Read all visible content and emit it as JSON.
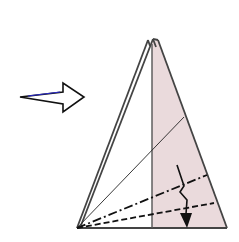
{
  "diagram": {
    "type": "origami-fold-step",
    "colors": {
      "paper_back": "#eadadc",
      "paper_front": "#ffffff",
      "outline": "#444444",
      "line": "#111111",
      "arrow_fill": "#ffffff",
      "arrow_accent": "#2a2acc"
    },
    "elements": [
      {
        "name": "direction-arrow",
        "kind": "hollow-arrow",
        "meaning": "next step / turn over"
      },
      {
        "name": "triangle-paper",
        "kind": "folded-triangle"
      },
      {
        "name": "center-crease",
        "kind": "solid-line"
      },
      {
        "name": "diagonal-crease",
        "kind": "thin-line"
      },
      {
        "name": "mountain-fold-line",
        "kind": "dash-dot"
      },
      {
        "name": "valley-fold-line",
        "kind": "dashed"
      },
      {
        "name": "fold-direction-arrow",
        "kind": "zigzag-arrow"
      }
    ]
  }
}
